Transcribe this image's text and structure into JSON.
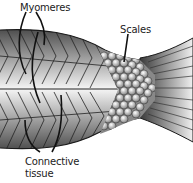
{
  "diagram": {
    "labels": {
      "myomeres": "Myomeres",
      "scales": "Scales",
      "connective_line1": "Connective",
      "connective_line2": "tissue"
    },
    "colors": {
      "outline": "#1a1a1a",
      "body_dark": "#3a3a3a",
      "body_light": "#f2f2f2",
      "background": "#ffffff"
    }
  }
}
